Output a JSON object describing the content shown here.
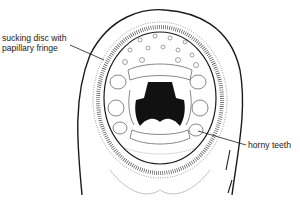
{
  "diagram": {
    "labels": [
      {
        "id": "disc",
        "lines": [
          "sucking disc with",
          "papillary fringe"
        ]
      },
      {
        "id": "teeth",
        "lines": [
          "horny teeth"
        ]
      }
    ],
    "colors": {
      "ink": "#1a1a1a",
      "background": "#ffffff"
    }
  }
}
